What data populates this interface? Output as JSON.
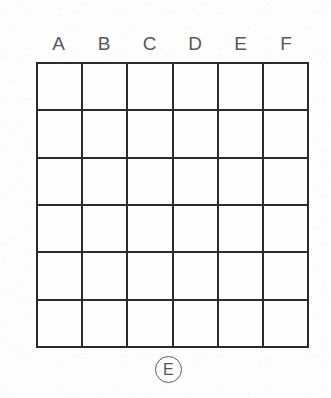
{
  "figure": {
    "kind": "blank-grid-worksheet",
    "background_color": "#fdfdfd",
    "line_color": "#2b2b2b",
    "text_color": "#585858"
  },
  "grid": {
    "columns": 6,
    "rows": 6,
    "column_headers": [
      "A",
      "B",
      "C",
      "D",
      "E",
      "F"
    ],
    "cells": [
      [
        "",
        "",
        "",
        "",
        "",
        ""
      ],
      [
        "",
        "",
        "",
        "",
        "",
        ""
      ],
      [
        "",
        "",
        "",
        "",
        "",
        ""
      ],
      [
        "",
        "",
        "",
        "",
        "",
        ""
      ],
      [
        "",
        "",
        "",
        "",
        "",
        ""
      ],
      [
        "",
        "",
        "",
        "",
        "",
        ""
      ]
    ]
  },
  "bottom_marker": {
    "letter": "E",
    "shape": "circle"
  }
}
